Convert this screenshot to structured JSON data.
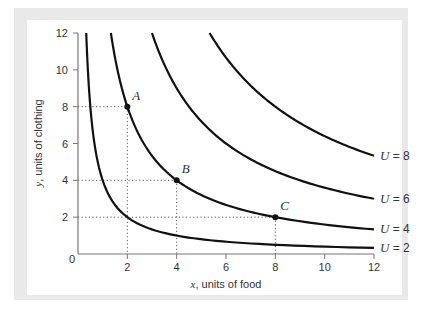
{
  "chart_data": {
    "type": "line",
    "title": "",
    "xlabel": "x, units of food",
    "xlabel_var": "x",
    "xlabel_text": ", units of food",
    "ylabel": "y, units of clothing",
    "ylabel_var": "y",
    "ylabel_text": ", units of clothing",
    "xlim": [
      0,
      12
    ],
    "ylim": [
      0,
      12
    ],
    "xticks": [
      0,
      2,
      4,
      6,
      8,
      10,
      12
    ],
    "yticks": [
      0,
      2,
      4,
      6,
      8,
      10,
      12
    ],
    "x_tick_labels": [
      "2",
      "4",
      "6",
      "8",
      "10",
      "12"
    ],
    "y_tick_labels": [
      "2",
      "4",
      "6",
      "8",
      "10",
      "12"
    ],
    "origin_label": "0",
    "grid": false,
    "series": [
      {
        "name": "U = 2",
        "label_var": "U",
        "label_value": "= 2",
        "equation": "xy = 4",
        "x": [
          0.33,
          0.5,
          1,
          2,
          4,
          8,
          12
        ],
        "y": [
          12,
          8,
          4,
          2,
          1,
          0.5,
          0.33
        ]
      },
      {
        "name": "U = 4",
        "label_var": "U",
        "label_value": "= 4",
        "equation": "xy = 16",
        "x": [
          1.33,
          2,
          4,
          8,
          12
        ],
        "y": [
          12,
          8,
          4,
          2,
          1.33
        ]
      },
      {
        "name": "U = 6",
        "label_var": "U",
        "label_value": "= 6",
        "equation": "xy = 36",
        "x": [
          3,
          4,
          6,
          9,
          12
        ],
        "y": [
          12,
          9,
          6,
          4,
          3
        ]
      },
      {
        "name": "U = 8",
        "label_var": "U",
        "label_value": "= 8",
        "equation": "xy = 64",
        "x": [
          5.33,
          8,
          12
        ],
        "y": [
          12,
          8,
          5.33
        ]
      }
    ],
    "points": [
      {
        "label": "A",
        "x": 2,
        "y": 8
      },
      {
        "label": "B",
        "x": 4,
        "y": 4
      },
      {
        "label": "C",
        "x": 8,
        "y": 2
      }
    ],
    "guide_lines": "dotted lines from each labeled point to both axes",
    "legend": "curve labels at right end of each curve"
  },
  "colors": {
    "curve": "#111111",
    "axis": "#777777",
    "frame": "#e9e9e9",
    "guide": "#555555"
  }
}
